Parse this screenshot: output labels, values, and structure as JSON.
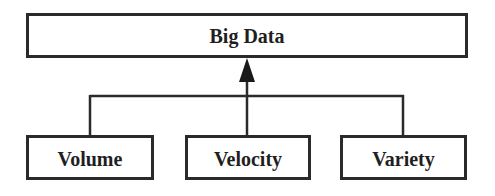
{
  "diagram": {
    "root": {
      "label": "Big Data"
    },
    "children": [
      {
        "label": "Volume"
      },
      {
        "label": "Velocity"
      },
      {
        "label": "Variety"
      }
    ],
    "colors": {
      "stroke": "#2a2a2a",
      "text": "#1f1f1f",
      "background": "#ffffff"
    }
  }
}
